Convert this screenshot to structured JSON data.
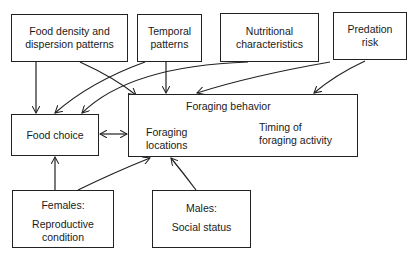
{
  "diagram": {
    "factors_top": [
      {
        "id": "food-density",
        "label_line1": "Food density and",
        "label_line2": "dispersion patterns"
      },
      {
        "id": "temporal",
        "label_line1": "Temporal",
        "label_line2": "patterns"
      },
      {
        "id": "nutritional",
        "label_line1": "Nutritional",
        "label_line2": "characteristics"
      },
      {
        "id": "predation",
        "label_line1": "Predation",
        "label_line2": "risk"
      }
    ],
    "food_choice": {
      "label": "Food choice"
    },
    "foraging_behavior": {
      "title": "Foraging behavior",
      "locations_line1": "Foraging",
      "locations_line2": "locations",
      "timing_line1": "Timing of",
      "timing_line2": "foraging activity"
    },
    "females": {
      "label_line1": "Females:",
      "label_line2": "Reproductive",
      "label_line3": "condition"
    },
    "males": {
      "label_line1": "Males:",
      "label_line2": "Social status"
    },
    "edges": [
      {
        "from": "food-density",
        "to": "food-choice"
      },
      {
        "from": "food-density",
        "to": "foraging-behavior"
      },
      {
        "from": "temporal",
        "to": "food-choice"
      },
      {
        "from": "temporal",
        "to": "foraging-behavior"
      },
      {
        "from": "nutritional",
        "to": "food-choice"
      },
      {
        "from": "nutritional",
        "to": "foraging-behavior"
      },
      {
        "from": "predation",
        "to": "food-choice"
      },
      {
        "from": "predation",
        "to": "foraging-behavior"
      },
      {
        "from": "food-choice",
        "to": "foraging-behavior",
        "bidirectional": true
      },
      {
        "from": "foraging-locations",
        "to": "timing-of-foraging-activity",
        "bidirectional": true
      },
      {
        "from": "females",
        "to": "food-choice"
      },
      {
        "from": "females",
        "to": "foraging-behavior"
      },
      {
        "from": "males",
        "to": "foraging-behavior"
      }
    ]
  }
}
